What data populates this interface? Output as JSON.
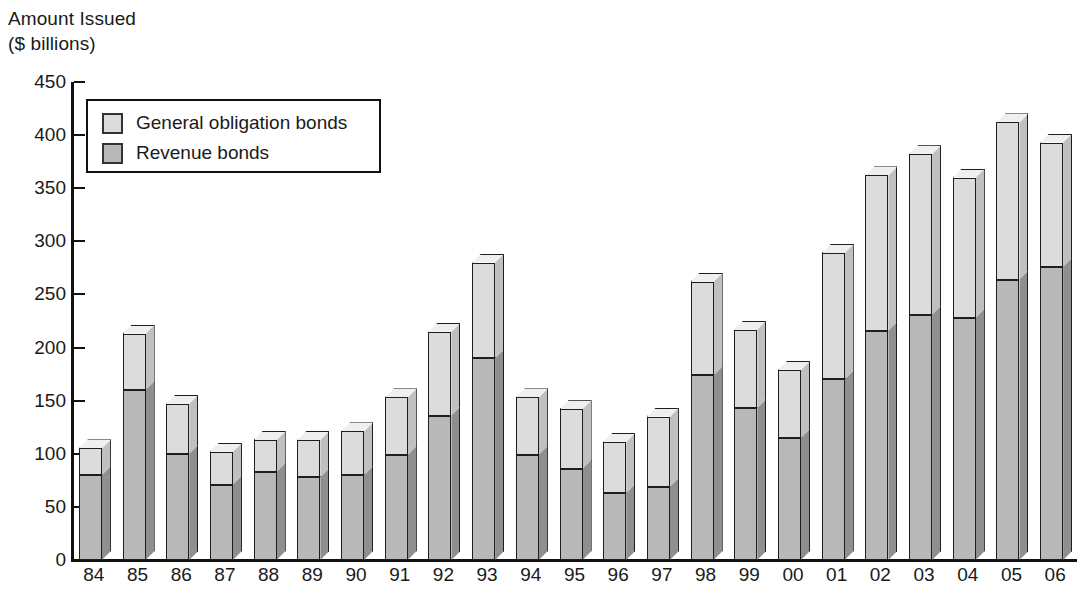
{
  "chart_data": {
    "type": "bar",
    "subtype": "stacked-3d-column",
    "title": "Amount Issued\n($ billions)",
    "xlabel": "",
    "ylabel": "Amount Issued ($ billions)",
    "ylim": [
      0,
      450
    ],
    "ytick_step": 50,
    "yticks": [
      0,
      50,
      100,
      150,
      200,
      250,
      300,
      350,
      400,
      450
    ],
    "grid": false,
    "legend_position": "top-left-inside",
    "categories": [
      "84",
      "85",
      "86",
      "87",
      "88",
      "89",
      "90",
      "91",
      "92",
      "93",
      "94",
      "95",
      "96",
      "97",
      "98",
      "99",
      "00",
      "01",
      "02",
      "03",
      "04",
      "05",
      "06"
    ],
    "series": [
      {
        "name": "Revenue bonds",
        "color": "#b8b8b8",
        "values": [
          80,
          160,
          100,
          71,
          83,
          78,
          80,
          99,
          136,
          190,
          99,
          86,
          63,
          69,
          174,
          143,
          115,
          170,
          216,
          231,
          228,
          264,
          276
        ]
      },
      {
        "name": "General obligation bonds",
        "color": "#dcdcdc",
        "values": [
          25,
          53,
          47,
          31,
          30,
          35,
          41,
          54,
          79,
          90,
          54,
          56,
          48,
          66,
          88,
          74,
          64,
          119,
          146,
          151,
          132,
          148,
          117
        ]
      }
    ],
    "totals": [
      105,
      213,
      147,
      102,
      113,
      113,
      121,
      153,
      215,
      280,
      153,
      142,
      111,
      135,
      262,
      217,
      179,
      289,
      362,
      382,
      360,
      412,
      393
    ],
    "annotations": []
  },
  "legend": {
    "items": [
      {
        "label": "General obligation bonds",
        "swatch": "#dcdcdc"
      },
      {
        "label": "Revenue bonds",
        "swatch": "#b8b8b8"
      }
    ]
  },
  "colors": {
    "go_front": "#dcdcdc",
    "go_side": "#c0c0c0",
    "rev_front": "#b8b8b8",
    "rev_side": "#8f8f8f",
    "axis": "#111111",
    "outline": "#1e1e1e",
    "background": "#ffffff"
  }
}
